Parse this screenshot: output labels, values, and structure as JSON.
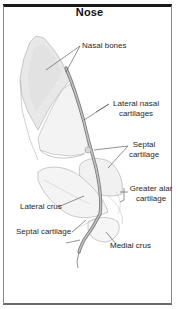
{
  "figure": {
    "title": "Nose",
    "colors": {
      "frame_top": "#1a1a1a",
      "frame_side": "#8a8a8a",
      "bone_fill": "#e6e6e6",
      "septum_stroke": "#7c7c7c",
      "septum_fill": "#b8b8b8",
      "outline": "#a0a0a0",
      "leader": "#4a4a4a",
      "label_text": "#2a2a2a"
    },
    "labels": [
      {
        "id": "nasal-bones",
        "text": "Nasal bones"
      },
      {
        "id": "lateral-nasal-cartilages",
        "line1": "Lateral nasal",
        "line2": "cartilages"
      },
      {
        "id": "septal-cartilage-upper",
        "line1": "Septal",
        "line2": "cartilage"
      },
      {
        "id": "greater-alar-cartilage",
        "line1": "Greater alar",
        "line2": "cartilage"
      },
      {
        "id": "lateral-crus",
        "text": "Lateral crus"
      },
      {
        "id": "septal-cartilage-lower",
        "text": "Septal cartilage"
      },
      {
        "id": "medial-crus",
        "text": "Medial crus"
      }
    ]
  }
}
